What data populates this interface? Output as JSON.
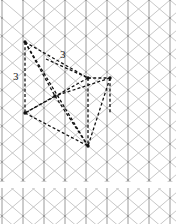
{
  "page": {
    "kind": "isometric-grid-paper-sketch",
    "width": 176,
    "height": 224,
    "background_color": "#ffffff"
  },
  "grid": {
    "name": "triangular-isometric-grid",
    "line_color": "#b9b9b9",
    "line_color_strong": "#9a9a9a",
    "line_width": 0.8,
    "vertical_pitch_px": 21,
    "row_pitch_px": 18,
    "x_origin": 2,
    "y_origin": 0,
    "columns": 10,
    "rows": 14,
    "sheet_gap": {
      "present": true,
      "y_start": 182,
      "y_end": 188,
      "color": "#ffffff"
    }
  },
  "figure": {
    "name": "dashed-prism-sketch",
    "stroke_color": "#121212",
    "stroke_width": 1.3,
    "dash_pattern": "3,2.2",
    "vertices": {
      "A": [
        25,
        42
      ],
      "B": [
        88,
        78
      ],
      "C": [
        110,
        78
      ],
      "D": [
        25,
        113
      ],
      "E": [
        88,
        146
      ],
      "F": [
        55,
        96
      ],
      "G": [
        46,
        59
      ],
      "H": [
        110,
        113
      ]
    },
    "edges": [
      {
        "name": "edge-A-B",
        "from": [
          25,
          42
        ],
        "to": [
          88,
          78
        ]
      },
      {
        "name": "edge-A-D",
        "from": [
          25,
          42
        ],
        "to": [
          25,
          113
        ]
      },
      {
        "name": "edge-A-F",
        "from": [
          25,
          42
        ],
        "to": [
          55,
          96
        ]
      },
      {
        "name": "edge-A-E",
        "from": [
          25,
          42
        ],
        "to": [
          88,
          146
        ]
      },
      {
        "name": "edge-B-C",
        "from": [
          88,
          78
        ],
        "to": [
          110,
          78
        ]
      },
      {
        "name": "edge-B-E",
        "from": [
          88,
          78
        ],
        "to": [
          88,
          146
        ]
      },
      {
        "name": "edge-B-D",
        "from": [
          88,
          78
        ],
        "to": [
          25,
          113
        ]
      },
      {
        "name": "edge-D-E",
        "from": [
          25,
          113
        ],
        "to": [
          88,
          146
        ]
      },
      {
        "name": "edge-C-E",
        "from": [
          110,
          78
        ],
        "to": [
          88,
          146
        ]
      },
      {
        "name": "edge-C-F",
        "from": [
          110,
          78
        ],
        "to": [
          55,
          96
        ]
      },
      {
        "name": "edge-F-E",
        "from": [
          55,
          96
        ],
        "to": [
          88,
          146
        ]
      },
      {
        "name": "edge-D-F",
        "from": [
          25,
          113
        ],
        "to": [
          55,
          96
        ]
      },
      {
        "name": "edge-G-B",
        "from": [
          46,
          59
        ],
        "to": [
          88,
          78
        ]
      },
      {
        "name": "edge-C-H",
        "from": [
          110,
          78
        ],
        "to": [
          110,
          113
        ]
      }
    ],
    "dots": [
      [
        25,
        42
      ],
      [
        88,
        78
      ],
      [
        110,
        78
      ],
      [
        25,
        113
      ],
      [
        88,
        146
      ],
      [
        55,
        96
      ]
    ]
  },
  "labels": {
    "upper": "3",
    "left": "3"
  }
}
